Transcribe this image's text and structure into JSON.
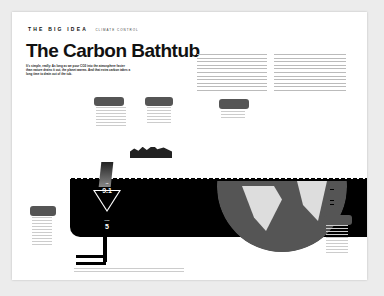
{
  "header": {
    "kicker": "THE BIG IDEA",
    "section": "CLIMATE CONTROL"
  },
  "article": {
    "title": "The Carbon Bathtub",
    "dek": "It's simple, really: As long as we pour CO2 into the atmosphere faster than nature drains it out, the planet warms. And that extra carbon takes a long time to drain out of the tub."
  },
  "graphic": {
    "inflow_label": "IN",
    "inflow_value": "9.1",
    "outflow_label": "OUT",
    "outflow_value": "5",
    "colors": {
      "tub": "#000000",
      "globe": "#555555",
      "land": "#dddddd",
      "bubble": "#555555"
    }
  }
}
